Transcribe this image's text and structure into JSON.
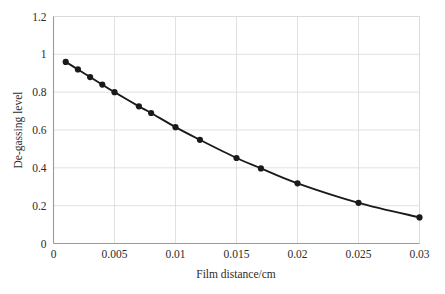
{
  "chart_data": {
    "type": "line",
    "title": "",
    "subtitle": "",
    "xlabel": "Film distance/cm",
    "ylabel": "De-gassing level",
    "xlim": [
      0,
      0.03
    ],
    "ylim": [
      0,
      1.2
    ],
    "grid": true,
    "legend": "none",
    "marker": "filled-circle",
    "line_color": "#1a1a1a",
    "marker_color": "#1a1a1a",
    "grid_color": "#d9d9d9",
    "frame_color": "#9a9a9a",
    "xticks": [
      0,
      0.005,
      0.01,
      0.015,
      0.02,
      0.025,
      0.03
    ],
    "xtick_labels": [
      "0",
      "0.005",
      "0.01",
      "0.015",
      "0.02",
      "0.025",
      "0.03"
    ],
    "yticks": [
      0,
      0.2,
      0.4,
      0.6,
      0.8,
      1,
      1.2
    ],
    "ytick_labels": [
      "0",
      "0.2",
      "0.4",
      "0.6",
      "0.8",
      "1",
      "1.2"
    ],
    "series": [
      {
        "name": "De-gassing level",
        "x": [
          0.001,
          0.002,
          0.003,
          0.004,
          0.005,
          0.007,
          0.008,
          0.01,
          0.012,
          0.015,
          0.017,
          0.02,
          0.025,
          0.03
        ],
        "y": [
          0.96,
          0.92,
          0.88,
          0.84,
          0.8,
          0.725,
          0.69,
          0.615,
          0.548,
          0.452,
          0.397,
          0.318,
          0.215,
          0.138
        ]
      }
    ]
  }
}
